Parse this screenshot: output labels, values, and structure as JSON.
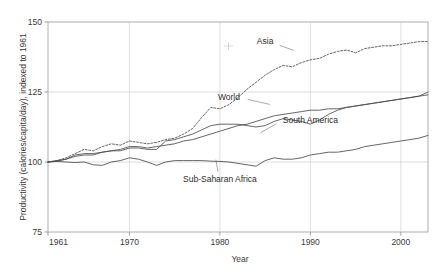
{
  "chart_data": {
    "type": "line",
    "title": "",
    "xlabel": "Year",
    "ylabel": "Productivity (calories/capita/day), indexed to 1961",
    "xlim": [
      1961,
      2003
    ],
    "ylim": [
      75,
      150
    ],
    "xticks": [
      1961,
      1970,
      1980,
      1990,
      2000
    ],
    "xticklabels": [
      "1961",
      "1970",
      "1980",
      "1990",
      "2000"
    ],
    "yticks": [
      75,
      100,
      125,
      150
    ],
    "yticklabels": [
      "75",
      "100",
      "125",
      "150"
    ],
    "grid": true,
    "legend": "inline-labels",
    "series": [
      {
        "name": "Asia",
        "style": "dotted",
        "label_x": 1985,
        "label_y": 142,
        "x": [
          1961,
          1962,
          1963,
          1964,
          1965,
          1966,
          1967,
          1968,
          1969,
          1970,
          1971,
          1972,
          1973,
          1974,
          1975,
          1976,
          1977,
          1978,
          1979,
          1980,
          1981,
          1982,
          1983,
          1984,
          1985,
          1986,
          1987,
          1988,
          1989,
          1990,
          1991,
          1992,
          1993,
          1994,
          1995,
          1996,
          1997,
          1998,
          1999,
          2000,
          2001,
          2002,
          2003
        ],
        "values": [
          100,
          100.5,
          101.5,
          103,
          104.5,
          104,
          105.5,
          106.5,
          106,
          107.5,
          107,
          106.5,
          107,
          108,
          108.5,
          110,
          112,
          116,
          119.5,
          119,
          120.5,
          123,
          126,
          128.5,
          131,
          133,
          134.5,
          134,
          135.5,
          136.5,
          137,
          138.5,
          139.5,
          140,
          139,
          140.5,
          141,
          141.5,
          141.5,
          142,
          142.5,
          143,
          143
        ]
      },
      {
        "name": "World",
        "style": "solid",
        "label_x": 1981,
        "label_y": 122,
        "x": [
          1961,
          1962,
          1963,
          1964,
          1965,
          1966,
          1967,
          1968,
          1969,
          1970,
          1971,
          1972,
          1973,
          1974,
          1975,
          1976,
          1977,
          1978,
          1979,
          1980,
          1981,
          1982,
          1983,
          1984,
          1985,
          1986,
          1987,
          1988,
          1989,
          1990,
          1991,
          1992,
          1993,
          1994,
          1995,
          1996,
          1997,
          1998,
          1999,
          2000,
          2001,
          2002,
          2003
        ],
        "values": [
          100,
          100.3,
          101,
          102,
          102.5,
          102.5,
          103.5,
          104,
          104.5,
          105.5,
          105.5,
          105,
          105.5,
          106,
          106.5,
          107.5,
          108,
          109,
          110,
          111,
          112,
          113,
          113.5,
          114.5,
          115.5,
          116.5,
          117,
          117.5,
          118,
          118.5,
          118.5,
          119,
          119,
          119.5,
          120,
          120.5,
          121,
          121.5,
          122,
          122.5,
          123,
          123.5,
          124
        ]
      },
      {
        "name": "South America",
        "style": "solid",
        "label_x": 1990,
        "label_y": 114,
        "x": [
          1961,
          1962,
          1963,
          1964,
          1965,
          1966,
          1967,
          1968,
          1969,
          1970,
          1971,
          1972,
          1973,
          1974,
          1975,
          1976,
          1977,
          1978,
          1979,
          1980,
          1981,
          1982,
          1983,
          1984,
          1985,
          1986,
          1987,
          1988,
          1989,
          1990,
          1991,
          1992,
          1993,
          1994,
          1995,
          1996,
          1997,
          1998,
          1999,
          2000,
          2001,
          2002,
          2003
        ],
        "values": [
          100,
          100.5,
          101,
          102.5,
          103,
          103,
          103.5,
          104,
          104,
          105,
          105,
          104.5,
          104.5,
          107.5,
          108,
          109,
          110,
          111.5,
          113,
          113.5,
          113.5,
          113.5,
          113,
          112.5,
          113,
          114.5,
          115.5,
          115,
          114.5,
          113.5,
          115,
          117,
          118.5,
          119.5,
          120,
          120.5,
          121,
          121.5,
          122,
          122.5,
          123,
          123.5,
          125
        ]
      },
      {
        "name": "Sub-Saharan Africa",
        "style": "solid",
        "label_x": 1980,
        "label_y": 93,
        "x": [
          1961,
          1962,
          1963,
          1964,
          1965,
          1966,
          1967,
          1968,
          1969,
          1970,
          1971,
          1972,
          1973,
          1974,
          1975,
          1976,
          1977,
          1978,
          1979,
          1980,
          1981,
          1982,
          1983,
          1984,
          1985,
          1986,
          1987,
          1988,
          1989,
          1990,
          1991,
          1992,
          1993,
          1994,
          1995,
          1996,
          1997,
          1998,
          1999,
          2000,
          2001,
          2002,
          2003
        ],
        "values": [
          100,
          100.2,
          100,
          99.8,
          100,
          99,
          98.8,
          100,
          100.5,
          101.5,
          101,
          100,
          98.8,
          100,
          100.5,
          100.5,
          100.5,
          100.5,
          100.3,
          100.2,
          100,
          99.5,
          99,
          98.5,
          100.5,
          101.5,
          101,
          101,
          101.5,
          102.5,
          103,
          103.5,
          103.5,
          104,
          104.5,
          105.5,
          106,
          106.5,
          107,
          107.5,
          108,
          108.5,
          109.5
        ]
      }
    ]
  },
  "annotations": {
    "stray_mark": "t"
  }
}
